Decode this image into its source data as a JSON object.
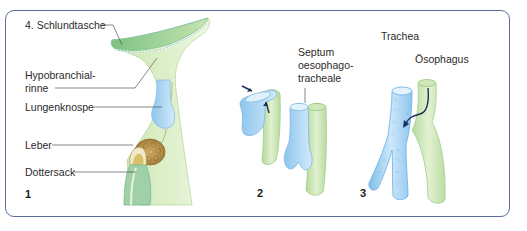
{
  "figure": {
    "panels": [
      {
        "number": "1",
        "labels": {
          "schlundtasche": "4. Schlundtasche",
          "hypobranchial_line1": "Hypobranchial-",
          "hypobranchial_line2": "rinne",
          "lungenknospe": "Lungenknospe",
          "leber": "Leber",
          "dottersack": "Dottersack"
        }
      },
      {
        "number": "2",
        "labels": {
          "septum_line1": "Septum",
          "septum_line2": "oesophago-",
          "septum_line3": "tracheale"
        }
      },
      {
        "number": "3",
        "labels": {
          "trachea": "Trachea",
          "oesophagus": "Ösophagus"
        }
      }
    ],
    "colors": {
      "frame": "#5a6e9c",
      "foregut_green": "#cfe6b8",
      "pouch_green": "#8fcb8f",
      "lung_blue": "#a9d4f0",
      "liver_brown": "#b98f4a",
      "arrow": "#1f2f5a",
      "leader_line": "#555555"
    }
  }
}
